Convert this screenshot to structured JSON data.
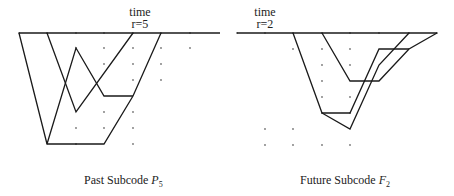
{
  "left": {
    "time_label": "time",
    "r_label": "r=5",
    "caption_text": "Past Subcode ",
    "caption_symbol": "P",
    "caption_sub": "5",
    "axis": [
      19,
      33,
      220,
      33
    ],
    "grid": [
      [
        19,
        33
      ],
      [
        47,
        33
      ],
      [
        76,
        33
      ],
      [
        104,
        33
      ],
      [
        133,
        33
      ],
      [
        161,
        33
      ],
      [
        190,
        33
      ],
      [
        76,
        48
      ],
      [
        104,
        48
      ],
      [
        133,
        48
      ],
      [
        161,
        48
      ],
      [
        190,
        48
      ],
      [
        104,
        64
      ],
      [
        133,
        64
      ],
      [
        161,
        64
      ],
      [
        133,
        80
      ],
      [
        161,
        80
      ],
      [
        104,
        112
      ],
      [
        133,
        112
      ],
      [
        76,
        128
      ],
      [
        104,
        128
      ],
      [
        133,
        128
      ],
      [
        76,
        144
      ],
      [
        133,
        144
      ]
    ],
    "paths": [
      [
        [
          19,
          33
        ],
        [
          47,
          144
        ],
        [
          104,
          144
        ],
        [
          133,
          96
        ],
        [
          161,
          33
        ]
      ],
      [
        [
          47,
          33
        ],
        [
          76,
          112
        ],
        [
          133,
          33
        ]
      ],
      [
        [
          47,
          144
        ],
        [
          76,
          48
        ],
        [
          104,
          96
        ],
        [
          133,
          96
        ]
      ]
    ]
  },
  "right": {
    "time_label": "time",
    "r_label": "r=2",
    "caption_text": "Future Subcode ",
    "caption_symbol": "F",
    "caption_sub": "2",
    "axis": [
      237,
      33,
      437,
      33
    ],
    "grid": [
      [
        237,
        33
      ],
      [
        265,
        33
      ],
      [
        293,
        33
      ],
      [
        322,
        33
      ],
      [
        350,
        33
      ],
      [
        379,
        33
      ],
      [
        409,
        33
      ],
      [
        437,
        33
      ],
      [
        293,
        49
      ],
      [
        322,
        49
      ],
      [
        350,
        49
      ],
      [
        322,
        65
      ],
      [
        350,
        65
      ],
      [
        322,
        81
      ],
      [
        322,
        97
      ],
      [
        350,
        97
      ],
      [
        322,
        113
      ],
      [
        350,
        113
      ],
      [
        265,
        129
      ],
      [
        293,
        129
      ],
      [
        265,
        145
      ],
      [
        293,
        145
      ],
      [
        322,
        145
      ],
      [
        350,
        145
      ]
    ],
    "paths": [
      [
        [
          322,
          33
        ],
        [
          350,
          81
        ],
        [
          379,
          81
        ],
        [
          409,
          49
        ],
        [
          437,
          33
        ]
      ],
      [
        [
          293,
          33
        ],
        [
          322,
          113
        ],
        [
          350,
          113
        ],
        [
          379,
          49
        ],
        [
          409,
          49
        ]
      ],
      [
        [
          322,
          113
        ],
        [
          350,
          129
        ],
        [
          379,
          65
        ],
        [
          409,
          33
        ]
      ]
    ]
  },
  "style": {
    "line_color": "#1a1a1a",
    "dot_color": "#777777"
  }
}
